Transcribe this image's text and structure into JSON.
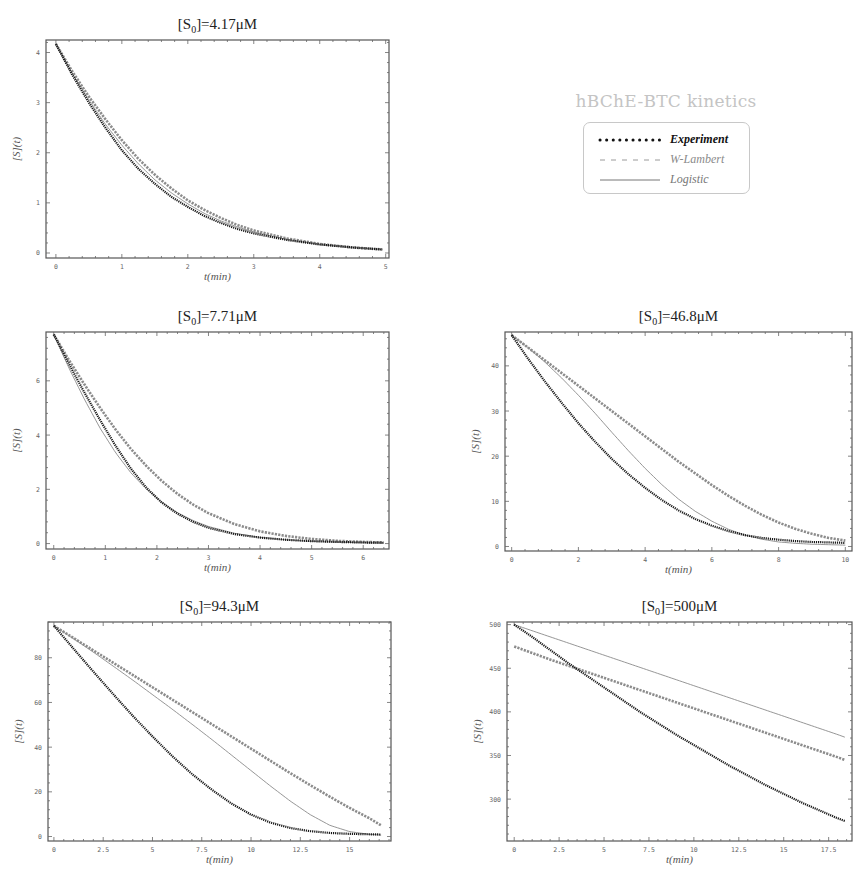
{
  "legend": {
    "title": "hBChE-BTC kinetics",
    "items": [
      {
        "label": "Experiment",
        "style": "dotted",
        "color": "#111111"
      },
      {
        "label": "W-Lambert",
        "style": "dashed",
        "color": "#8c8c8c"
      },
      {
        "label": "Logistic",
        "style": "solid",
        "color": "#777777"
      }
    ]
  },
  "chart_data": [
    {
      "type": "line",
      "title": "[S0]=4.17μM",
      "xlabel": "t(min)",
      "ylabel": "[S](t)",
      "xlim": [
        -0.15,
        5.05
      ],
      "ylim": [
        -0.1,
        4.25
      ],
      "xticks": [
        0,
        1,
        2,
        3,
        4,
        5
      ],
      "xtick_labels": [
        "0",
        "1",
        "2",
        "3",
        "4",
        "5"
      ],
      "yticks": [
        0,
        1,
        2,
        3,
        4
      ],
      "ytick_labels": [
        "0",
        "1",
        "2",
        "3",
        "4"
      ],
      "grid": false,
      "frame": {
        "x": 46,
        "y": 40,
        "w": 343,
        "h": 218
      },
      "series": [
        {
          "name": "Experiment",
          "x": [
            0,
            0.25,
            0.5,
            0.75,
            1,
            1.25,
            1.5,
            1.75,
            2,
            2.25,
            2.5,
            2.75,
            3,
            3.5,
            4,
            4.5,
            4.95
          ],
          "y": [
            4.17,
            3.55,
            3.0,
            2.5,
            2.05,
            1.68,
            1.38,
            1.12,
            0.92,
            0.74,
            0.6,
            0.48,
            0.39,
            0.26,
            0.17,
            0.11,
            0.07
          ]
        },
        {
          "name": "W-Lambert",
          "x": [
            0,
            0.25,
            0.5,
            0.75,
            1,
            1.25,
            1.5,
            1.75,
            2,
            2.25,
            2.5,
            2.75,
            3,
            3.5,
            4,
            4.5,
            4.95
          ],
          "y": [
            4.17,
            3.62,
            3.12,
            2.67,
            2.25,
            1.88,
            1.56,
            1.29,
            1.05,
            0.86,
            0.7,
            0.56,
            0.45,
            0.29,
            0.18,
            0.11,
            0.07
          ]
        },
        {
          "name": "Logistic",
          "x": [
            0,
            0.25,
            0.5,
            0.75,
            1,
            1.25,
            1.5,
            1.75,
            2,
            2.25,
            2.5,
            2.75,
            3,
            3.5,
            4,
            4.5,
            4.95
          ],
          "y": [
            4.17,
            3.58,
            3.05,
            2.57,
            2.15,
            1.78,
            1.46,
            1.2,
            0.98,
            0.79,
            0.64,
            0.52,
            0.42,
            0.27,
            0.17,
            0.11,
            0.07
          ]
        }
      ]
    },
    {
      "type": "line",
      "title": "[S0]=7.71μM",
      "xlabel": "t(min)",
      "ylabel": "[S](t)",
      "xlim": [
        -0.15,
        6.5
      ],
      "ylim": [
        -0.2,
        7.8
      ],
      "xticks": [
        0,
        1,
        2,
        3,
        4,
        5,
        6
      ],
      "xtick_labels": [
        "0",
        "1",
        "2",
        "3",
        "4",
        "5",
        "6"
      ],
      "yticks": [
        0,
        2,
        4,
        6
      ],
      "ytick_labels": [
        "0",
        "2",
        "4",
        "6"
      ],
      "grid": false,
      "frame": {
        "x": 46,
        "y": 332,
        "w": 343,
        "h": 217
      },
      "series": [
        {
          "name": "Experiment",
          "x": [
            0,
            0.3,
            0.6,
            0.9,
            1.2,
            1.5,
            1.8,
            2.1,
            2.4,
            2.7,
            3.0,
            3.5,
            4,
            4.5,
            5,
            5.5,
            6,
            6.4
          ],
          "y": [
            7.71,
            6.6,
            5.55,
            4.55,
            3.6,
            2.75,
            2.05,
            1.5,
            1.1,
            0.8,
            0.58,
            0.35,
            0.22,
            0.14,
            0.09,
            0.06,
            0.04,
            0.03
          ]
        },
        {
          "name": "W-Lambert",
          "x": [
            0,
            0.3,
            0.6,
            0.9,
            1.2,
            1.5,
            1.8,
            2.1,
            2.4,
            2.7,
            3.0,
            3.5,
            4,
            4.5,
            5,
            5.5,
            6,
            6.4
          ],
          "y": [
            7.71,
            6.75,
            5.85,
            5.0,
            4.2,
            3.48,
            2.85,
            2.3,
            1.83,
            1.44,
            1.12,
            0.72,
            0.45,
            0.28,
            0.17,
            0.1,
            0.06,
            0.04
          ]
        },
        {
          "name": "Logistic",
          "x": [
            0,
            0.3,
            0.6,
            0.9,
            1.2,
            1.5,
            1.8,
            2.1,
            2.4,
            2.7,
            3.0,
            3.5,
            4,
            4.5,
            5,
            5.5,
            6,
            6.4
          ],
          "y": [
            7.71,
            6.45,
            5.3,
            4.25,
            3.35,
            2.6,
            2.0,
            1.52,
            1.14,
            0.85,
            0.63,
            0.38,
            0.23,
            0.14,
            0.08,
            0.05,
            0.03,
            0.02
          ]
        }
      ]
    },
    {
      "type": "line",
      "title": "[S0]=46.8μM",
      "xlabel": "t(min)",
      "ylabel": "[S](t)",
      "xlim": [
        -0.2,
        10.2
      ],
      "ylim": [
        -1,
        47.5
      ],
      "xticks": [
        0,
        2,
        4,
        6,
        8,
        10
      ],
      "xtick_labels": [
        "0",
        "2",
        "4",
        "6",
        "8",
        "10"
      ],
      "yticks": [
        0,
        10,
        20,
        30,
        40
      ],
      "ytick_labels": [
        "0",
        "10",
        "20",
        "30",
        "40"
      ],
      "grid": false,
      "frame": {
        "x": 505,
        "y": 332,
        "w": 347,
        "h": 219
      },
      "series": [
        {
          "name": "Experiment",
          "x": [
            0,
            0.5,
            1,
            1.5,
            2,
            2.5,
            3,
            3.5,
            4,
            4.5,
            5,
            5.5,
            6,
            6.5,
            7,
            7.5,
            8,
            8.5,
            9,
            9.5,
            10
          ],
          "y": [
            46.8,
            41.5,
            36.5,
            31.8,
            27.3,
            23.2,
            19.4,
            16.0,
            13.0,
            10.3,
            8.0,
            6.1,
            4.6,
            3.4,
            2.5,
            1.9,
            1.5,
            1.2,
            1.0,
            0.9,
            0.8
          ]
        },
        {
          "name": "W-Lambert",
          "x": [
            0,
            0.5,
            1,
            1.5,
            2,
            2.5,
            3,
            3.5,
            4,
            4.5,
            5,
            5.5,
            6,
            6.5,
            7,
            7.5,
            8,
            8.5,
            9,
            9.5,
            10
          ],
          "y": [
            46.8,
            44.0,
            41.2,
            38.4,
            35.6,
            32.8,
            30.0,
            27.2,
            24.4,
            21.6,
            18.8,
            16.2,
            13.6,
            11.2,
            9.0,
            7.0,
            5.3,
            3.9,
            2.8,
            1.9,
            1.3
          ]
        },
        {
          "name": "Logistic",
          "x": [
            0,
            0.5,
            1,
            1.5,
            2,
            2.5,
            3,
            3.5,
            4,
            4.5,
            5,
            5.5,
            6,
            6.5,
            7,
            7.5,
            8,
            8.5,
            9,
            9.5,
            10
          ],
          "y": [
            46.8,
            44.0,
            40.8,
            37.3,
            33.5,
            29.5,
            25.3,
            21.2,
            17.3,
            13.7,
            10.5,
            7.8,
            5.6,
            3.8,
            2.5,
            1.6,
            1.0,
            0.7,
            0.5,
            0.4,
            0.3
          ]
        }
      ]
    },
    {
      "type": "line",
      "title": "[S0]=94.3μM",
      "xlabel": "t(min)",
      "ylabel": "[S](t)",
      "xlim": [
        -0.3,
        17.1
      ],
      "ylim": [
        -2,
        96
      ],
      "xticks": [
        0,
        2.5,
        5,
        7.5,
        10,
        12.5,
        15
      ],
      "xtick_labels": [
        "0",
        "2.5",
        "5",
        "7.5",
        "10",
        "12.5",
        "15"
      ],
      "yticks": [
        0,
        20,
        40,
        60,
        80
      ],
      "ytick_labels": [
        "0",
        "20",
        "40",
        "60",
        "80"
      ],
      "grid": false,
      "frame": {
        "x": 48,
        "y": 622,
        "w": 343,
        "h": 219
      },
      "series": [
        {
          "name": "Experiment",
          "x": [
            0,
            1,
            2,
            3,
            4,
            5,
            6,
            7,
            8,
            9,
            10,
            11,
            12,
            13,
            14,
            15,
            16,
            16.6
          ],
          "y": [
            94.3,
            84.0,
            73.8,
            63.8,
            54.0,
            44.8,
            36.0,
            28.0,
            21.0,
            14.8,
            9.8,
            6.2,
            3.8,
            2.4,
            1.6,
            1.2,
            1.0,
            0.9
          ]
        },
        {
          "name": "W-Lambert",
          "x": [
            0,
            1,
            2,
            3,
            4,
            5,
            6,
            7,
            8,
            9,
            10,
            11,
            12,
            13,
            14,
            15,
            16,
            16.6
          ],
          "y": [
            94.3,
            88.8,
            83.3,
            77.8,
            72.3,
            66.8,
            61.3,
            55.8,
            50.3,
            44.8,
            39.3,
            33.8,
            28.3,
            23.0,
            17.8,
            12.8,
            8.2,
            5.0
          ]
        },
        {
          "name": "Logistic",
          "x": [
            0,
            1,
            2,
            3,
            4,
            5,
            6,
            7,
            8,
            9,
            10,
            11,
            12,
            13,
            14,
            15,
            16,
            16.6
          ],
          "y": [
            94.3,
            88.5,
            82.5,
            76.3,
            70.0,
            63.5,
            57.0,
            50.3,
            43.5,
            36.5,
            29.5,
            22.5,
            15.8,
            9.8,
            5.0,
            2.2,
            1.0,
            0.6
          ]
        }
      ]
    },
    {
      "type": "line",
      "title": "[S0]=500μM",
      "xlabel": "t(min)",
      "ylabel": "[S](t)",
      "xlim": [
        -0.4,
        18.8
      ],
      "ylim": [
        252,
        503
      ],
      "xticks": [
        0,
        2.5,
        5,
        7.5,
        10,
        12.5,
        15,
        17.5
      ],
      "xtick_labels": [
        "0",
        "2.5",
        "5",
        "7.5",
        "10",
        "12.5",
        "15",
        "17.5"
      ],
      "yticks": [
        300,
        350,
        400,
        450,
        500
      ],
      "ytick_labels": [
        "300",
        "350",
        "400",
        "450",
        "500"
      ],
      "grid": false,
      "frame": {
        "x": 507,
        "y": 622,
        "w": 345,
        "h": 219
      },
      "series": [
        {
          "name": "Experiment",
          "x": [
            0,
            1,
            2,
            3,
            4,
            5,
            6,
            7,
            8,
            9,
            10,
            11,
            12,
            13,
            14,
            15,
            16,
            17,
            18,
            18.4
          ],
          "y": [
            500,
            486,
            471,
            456,
            442,
            428,
            414,
            400,
            387,
            374,
            362,
            350,
            338,
            327,
            316,
            306,
            296,
            287,
            278,
            275
          ]
        },
        {
          "name": "W-Lambert",
          "x": [
            0,
            2,
            4,
            6,
            8,
            10,
            12,
            14,
            16,
            18,
            18.4
          ],
          "y": [
            475,
            460,
            446,
            432,
            418,
            404,
            390,
            376,
            362,
            348,
            345
          ]
        },
        {
          "name": "Logistic",
          "x": [
            0,
            2,
            4,
            6,
            8,
            10,
            12,
            14,
            16,
            18,
            18.4
          ],
          "y": [
            500,
            486,
            472,
            458,
            444,
            430,
            416,
            402,
            388,
            374,
            371
          ]
        }
      ]
    }
  ]
}
